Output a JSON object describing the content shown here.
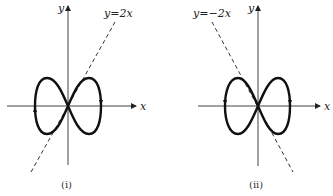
{
  "figure": {
    "panels": [
      {
        "id": "i",
        "caption": "(i)",
        "x_axis_label": "x",
        "y_axis_label": "y",
        "line_label": "y=2x",
        "line_slope": 2
      },
      {
        "id": "ii",
        "caption": "(ii)",
        "x_axis_label": "x",
        "y_axis_label": "y",
        "line_label": "y=−2x",
        "line_slope": -2
      }
    ],
    "colors": {
      "curve": "#111111",
      "axes": "#333333",
      "dashed_line": "#333333"
    }
  }
}
